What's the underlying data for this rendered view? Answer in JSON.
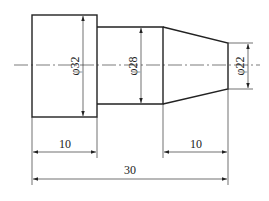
{
  "drawing": {
    "type": "stepped shaft technical drawing",
    "diameters": {
      "large": "φ32",
      "middle": "φ28",
      "small": "φ22"
    },
    "lengths": {
      "large_section": "10",
      "cone_section": "10",
      "overall": "30"
    },
    "colors": {
      "line": "#222222",
      "background": "#ffffff"
    }
  }
}
